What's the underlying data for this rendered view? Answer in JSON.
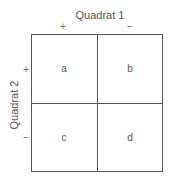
{
  "diagram": {
    "title_top": "Quadrat 1",
    "title_left": "Quadrat 2",
    "top_signs": [
      "+",
      "−"
    ],
    "left_signs": [
      "+",
      "−"
    ],
    "cells": [
      {
        "label": "a"
      },
      {
        "label": "b"
      },
      {
        "label": "c"
      },
      {
        "label": "d"
      }
    ],
    "line_color": "#555555"
  }
}
